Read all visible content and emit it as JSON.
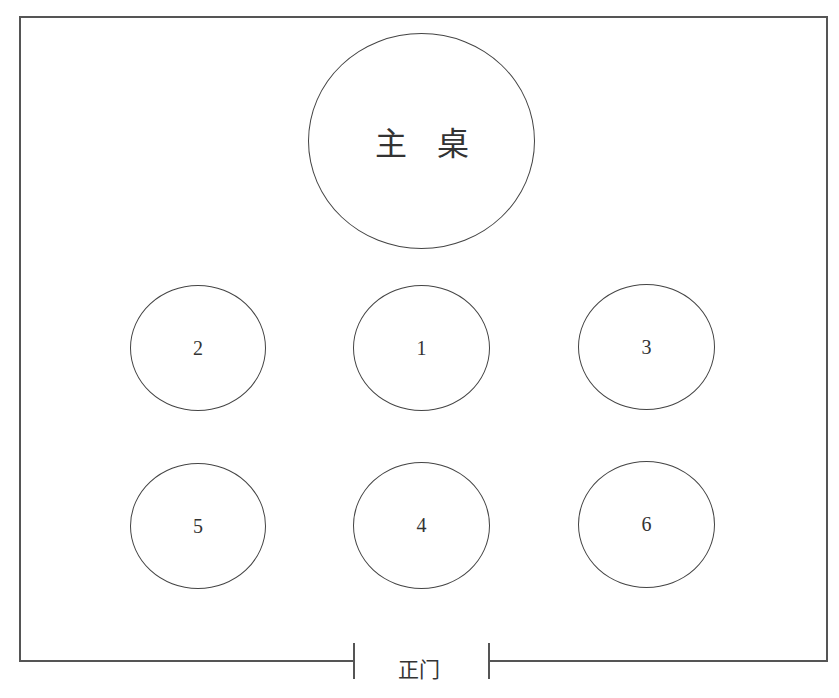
{
  "diagram": {
    "type": "banquet seating layout",
    "colors": {
      "line": "#444444",
      "text": "#333333",
      "background": "#ffffff"
    },
    "main_table": {
      "label": "主桌"
    },
    "tables": [
      {
        "id": "2",
        "label": "2",
        "row": 1,
        "col": 1
      },
      {
        "id": "1",
        "label": "1",
        "row": 1,
        "col": 2
      },
      {
        "id": "3",
        "label": "3",
        "row": 1,
        "col": 3
      },
      {
        "id": "5",
        "label": "5",
        "row": 2,
        "col": 1
      },
      {
        "id": "4",
        "label": "4",
        "row": 2,
        "col": 2
      },
      {
        "id": "6",
        "label": "6",
        "row": 2,
        "col": 3
      }
    ],
    "entrance": {
      "label": "正门"
    }
  }
}
